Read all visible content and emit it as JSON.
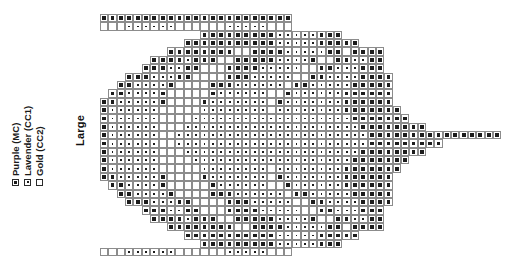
{
  "legend": {
    "title": "Colour key",
    "items": [
      {
        "label": "Purple (MC)",
        "symbol": "filled-square",
        "code": "mc",
        "color": "#4b2a6b"
      },
      {
        "label": "Lavender (CC1)",
        "symbol": "dotted-square",
        "code": "cc1",
        "color": "#b9a6d6"
      },
      {
        "label": "Gold (CC2)",
        "symbol": "empty-square",
        "code": "cc2",
        "color": "#d8b548"
      }
    ]
  },
  "size": {
    "label": "Large"
  },
  "chart_data": {
    "type": "heatmap",
    "title": "Large",
    "xlabel": "",
    "ylabel": "",
    "columns": 48,
    "rows": 30,
    "cell_px": 8.37,
    "palette": {
      "mc": "#1c1c1c",
      "cc1": "#ffffff",
      "cc2": "#ffffff",
      "grid": "#8c8c8c"
    },
    "symbol_legend": [
      "mc",
      "cc1",
      "cc2"
    ],
    "grid": [
      "mcmcmcmcmcmcmcmcmcmcmcmcmcmcmcmcmcmcmcmcmcmc..............................................",
      "cc2cc2cc2cc1cc1cc1cc1cc1cc1cc2cc2cc2cc2cc2cc1cc1cc1cc1cc1cc1cc2",
      "ROWSTRING"
    ],
    "rows_data": [
      {
        "start": 0,
        "cells": "mc,mc,mc,mc,mc,mc,mc,mc,mc,mc,mc,mc,mc,mc,mc,mc,mc,mc,mc,mc,mc,mc,mc"
      },
      {
        "start": 0,
        "cells": "cc2,cc2,cc2,cc1,cc1,cc1,cc1,cc1,cc1,cc2,cc2,cc2,cc2,cc2,cc2,cc1,cc1,cc1,cc1,cc1,cc2,cc2,cc2"
      },
      {
        "start": 12,
        "cells": "mc,mc,mc,mc,mc,mc,mc,mc,mc,cc1,cc1,cc1,cc1,cc1,mc,mc,mc"
      },
      {
        "start": 10,
        "cells": "mc,mc,mc,mc,mc,mc,mc,mc,mc,mc,mc,cc1,cc1,cc1,cc1,cc1,mc,mc,mc,mc,mc"
      },
      {
        "start": 8,
        "cells": "mc,mc,mc,mc,mc,mc,mc,mc,cc2,cc2,mc,mc,mc,mc,cc1,cc1,cc1,cc1,cc1,mc,mc,cc2,mc,mc,mc,mc"
      },
      {
        "start": 6,
        "cells": "mc,mc,mc,mc,cc1,mc,mc,mc,cc2,cc2,mc,mc,mc,mc,mc,cc1,cc1,cc1,cc1,mc,cc2,cc2,mc,mc,cc1,cc1,mc,mc"
      },
      {
        "start": 5,
        "cells": "mc,mc,mc,cc1,cc1,mc,mc,cc2,cc2,cc2,mc,mc,mc,mc,cc1,cc1,cc1,cc1,cc1,cc2,cc2,mc,mc,cc1,cc1,cc1,mc,mc,mc"
      },
      {
        "start": 3,
        "cells": "mc,mc,mc,cc1,cc1,cc1,mc,mc,cc2,cc2,cc2,cc2,mc,mc,mc,cc1,cc1,cc1,cc1,cc1,cc2,cc2,mc,mc,cc1,cc1,cc1,cc1,mc,mc,mc,mc"
      },
      {
        "start": 2,
        "cells": "mc,mc,cc1,cc1,cc1,cc1,mc,cc2,cc2,cc2,cc2,mc,mc,mc,cc1,cc1,cc1,cc1,cc1,cc1,cc2,mc,mc,cc1,cc1,cc1,cc1,cc1,mc,mc,mc,mc,mc"
      },
      {
        "start": 1,
        "cells": "mc,mc,cc1,cc1,cc1,cc1,mc,cc2,cc2,cc2,cc2,cc2,mc,cc1,cc1,cc1,cc1,cc1,cc1,cc2,cc2,mc,cc1,cc1,cc1,cc1,cc1,cc1,mc,mc,mc,mc,mc,mc"
      },
      {
        "start": 0,
        "cells": "mc,mc,cc1,cc1,cc1,cc1,cc1,mc,cc2,cc2,cc2,cc2,mc,cc1,cc1,cc1,cc1,cc1,cc1,cc1,cc2,mc,cc1,cc1,cc1,cc1,cc1,cc1,cc1,mc,mc,mc,mc,mc,mc"
      },
      {
        "start": 0,
        "cells": "mc,cc1,cc1,cc1,cc1,cc1,cc1,cc2,cc2,cc2,cc2,cc2,cc1,cc1,cc1,cc1,cc1,cc1,cc1,cc1,cc2,cc1,cc1,cc1,cc1,cc1,cc1,cc1,cc1,mc,mc,mc,mc,mc,mc,mc"
      },
      {
        "start": 0,
        "cells": "mc,cc1,cc1,cc1,cc1,cc1,cc1,cc2,cc2,cc2,cc2,cc1,cc1,cc1,cc1,cc1,cc1,cc1,cc1,cc1,cc1,cc1,cc1,cc1,cc1,cc1,cc1,cc1,cc1,cc1,mc,mc,mc,mc,mc,mc,mc"
      },
      {
        "start": 0,
        "cells": "mc,cc1,cc1,cc1,cc1,cc1,cc1,cc2,cc2,cc2,cc1,cc1,cc1,cc1,cc1,cc1,cc1,cc1,cc1,cc1,cc1,cc1,cc1,cc1,cc1,cc1,cc1,cc1,cc1,cc1,cc1,mc,mc,mc,mc,mc,mc,mc,mc"
      },
      {
        "start": 0,
        "cells": "mc,cc1,cc1,cc1,cc1,cc1,cc1,cc2,cc2,cc1,cc1,cc1,cc1,cc1,cc1,cc1,cc1,cc1,cc1,cc1,cc1,cc1,cc1,cc1,cc1,cc1,cc1,cc1,cc1,cc1,cc1,cc1,mc,mc,mc,mc,mc,mc,mc,mc,mc,mc,mc,mc,mc,mc,mc,mc"
      },
      {
        "start": 0,
        "cells": "mc,cc1,cc1,cc1,cc1,cc1,cc1,cc2,cc2,cc1,cc1,cc1,cc1,cc1,cc1,cc1,cc1,cc1,cc1,cc1,cc1,cc1,cc1,cc1,cc1,cc1,cc1,cc1,cc1,cc1,cc1,cc1,mc,mc,mc,mc,mc,mc,mc,mc,mc"
      },
      {
        "start": 0,
        "cells": "mc,cc1,cc1,cc1,cc1,cc1,cc1,cc2,cc2,cc2,cc1,cc1,cc1,cc1,cc1,cc1,cc1,cc1,cc1,cc1,cc1,cc1,cc1,cc1,cc1,cc1,cc1,cc1,cc1,cc1,cc1,mc,mc,mc,mc,mc,mc,mc,mc"
      },
      {
        "start": 0,
        "cells": "mc,cc1,cc1,cc1,cc1,cc1,cc1,cc2,cc2,cc2,cc2,cc1,cc1,cc1,cc1,cc1,cc1,cc1,cc1,cc1,cc1,cc1,cc1,cc1,cc1,cc1,cc1,cc1,cc1,cc1,mc,mc,mc,mc,mc,mc,mc"
      },
      {
        "start": 0,
        "cells": "mc,cc1,cc1,cc1,cc1,cc1,cc1,cc2,cc2,cc2,cc2,cc2,cc1,cc1,cc1,cc1,cc1,cc1,cc1,cc1,cc2,cc1,cc1,cc1,cc1,cc1,cc1,cc1,cc1,mc,mc,mc,mc,mc,mc,mc"
      },
      {
        "start": 0,
        "cells": "mc,mc,cc1,cc1,cc1,cc1,cc1,mc,cc2,cc2,cc2,cc2,mc,cc1,cc1,cc1,cc1,cc1,cc1,cc1,cc2,mc,cc1,cc1,cc1,cc1,cc1,cc1,cc1,mc,mc,mc,mc,mc,mc"
      },
      {
        "start": 1,
        "cells": "mc,mc,cc1,cc1,cc1,cc1,mc,cc2,cc2,cc2,cc2,cc2,mc,cc1,cc1,cc1,cc1,cc1,cc1,cc2,cc2,mc,cc1,cc1,cc1,cc1,cc1,cc1,mc,mc,mc,mc,mc,mc"
      },
      {
        "start": 2,
        "cells": "mc,mc,cc1,cc1,cc1,cc1,mc,cc2,cc2,cc2,cc2,mc,mc,mc,cc1,cc1,cc1,cc1,cc1,cc1,cc2,mc,mc,cc1,cc1,cc1,cc1,cc1,mc,mc,mc,mc,mc"
      },
      {
        "start": 3,
        "cells": "mc,mc,mc,cc1,cc1,cc1,mc,mc,cc2,cc2,cc2,cc2,mc,mc,mc,cc1,cc1,cc1,cc1,cc1,cc2,cc2,mc,mc,cc1,cc1,cc1,cc1,mc,mc,mc,mc"
      },
      {
        "start": 5,
        "cells": "mc,mc,mc,cc1,cc1,mc,mc,cc2,cc2,cc2,mc,mc,mc,mc,cc1,cc1,cc1,cc1,cc1,cc2,cc2,mc,mc,cc1,cc1,cc1,mc,mc,mc"
      },
      {
        "start": 6,
        "cells": "mc,mc,mc,mc,cc1,mc,mc,mc,cc2,cc2,mc,mc,mc,mc,mc,cc1,cc1,cc1,cc1,mc,cc2,cc2,mc,mc,cc1,cc1,mc,mc"
      },
      {
        "start": 8,
        "cells": "mc,mc,mc,mc,mc,mc,mc,mc,cc2,cc2,mc,mc,mc,mc,cc1,cc1,cc1,cc1,cc1,mc,mc,cc2,mc,mc,mc,mc"
      },
      {
        "start": 10,
        "cells": "mc,mc,mc,mc,mc,mc,mc,mc,mc,mc,mc,cc1,cc1,cc1,cc1,cc1,mc,mc,mc,mc,mc"
      },
      {
        "start": 12,
        "cells": "mc,mc,mc,mc,mc,mc,mc,mc,mc,cc1,cc1,cc1,cc1,cc1,mc,mc,mc"
      },
      {
        "start": 0,
        "cells": "cc2,cc2,cc2,cc1,cc1,cc1,cc1,cc1,cc1,cc2,cc2,cc2,cc2,cc2,cc2,cc1,cc1,cc1,cc1,cc1,cc2,cc2,cc2"
      },
      {
        "start": 0,
        "cells": ""
      }
    ]
  }
}
